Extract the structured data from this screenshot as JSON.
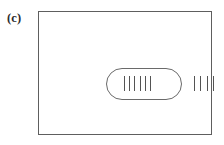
{
  "figure": {
    "panel_label": "(c)",
    "background_color": "#ffffff",
    "line_color": "#5e5e5e",
    "tick_color": "#545454",
    "frame": {
      "name": "outer-rectangle",
      "shape": "rectangle",
      "stroke": "#5e5e5e"
    },
    "capsule": {
      "name": "rounded-enclosure",
      "shape": "rounded-rectangle",
      "stroke": "#6a6a6a"
    },
    "tick_groups": [
      {
        "name": "inner-tick-group",
        "location": "inside-capsule",
        "count": 6,
        "orientation": "vertical"
      },
      {
        "name": "outer-tick-group",
        "location": "right-of-capsule",
        "count": 4,
        "orientation": "vertical"
      }
    ]
  }
}
